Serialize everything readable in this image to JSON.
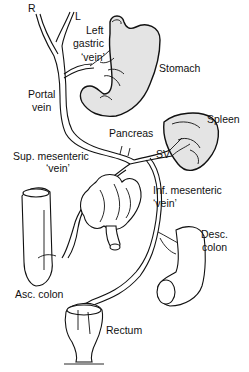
{
  "diagram": {
    "labels": {
      "right": "R",
      "left": "L",
      "left_gastric_1": "Left",
      "left_gastric_2": "gastric",
      "left_gastric_3": "‘vein’",
      "stomach": "Stomach",
      "portal_1": "Portal",
      "portal_2": "vein",
      "spleen": "Spleen",
      "pancreas": "Pancreas",
      "sv": "SV",
      "sup_mes_1": "Sup. mesenteric",
      "sup_mes_2": "‘vein’",
      "inf_mes_1": "Inf. mesenteric",
      "inf_mes_2": "‘vein’",
      "desc_1": "Desc.",
      "desc_2": "colon",
      "asc": "Asc. colon",
      "rectum": "Rectum"
    },
    "colors": {
      "line": "#111111",
      "organ_fill": "#e4e4e4",
      "background": "#ffffff"
    }
  }
}
